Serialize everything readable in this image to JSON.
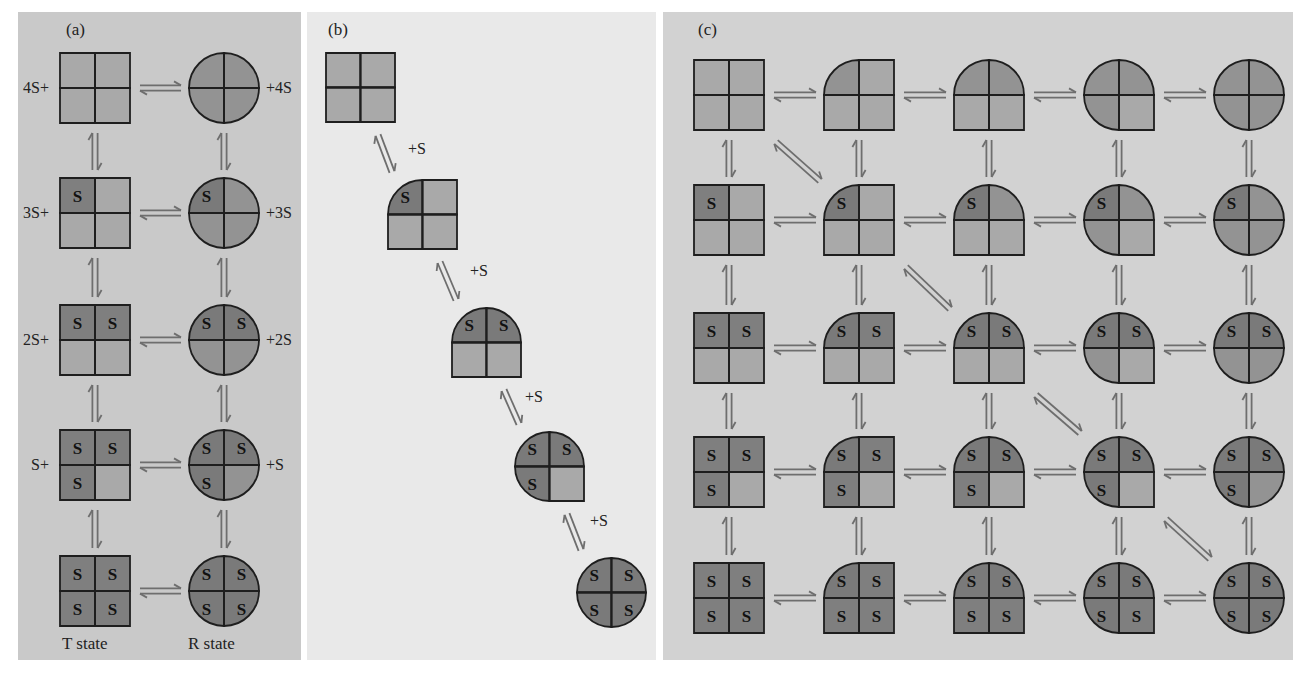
{
  "colors": {
    "panel_a_bg": "#c9c9c9",
    "panel_b_bg": "#e9e9e9",
    "panel_c_bg": "#d2d2d2",
    "t_subunit": "#a9a9a9",
    "r_subunit": "#939393",
    "bound_t_subunit": "#7f7f7f",
    "bound_r_subunit": "#7a7a7a",
    "outline": "#1e1e1e",
    "arrow": "#6e6e6e",
    "text": "#222222"
  },
  "panels": {
    "a": {
      "label": "(a)",
      "t_state_label": "T state",
      "r_state_label": "R state",
      "rows": [
        {
          "left_label": "4S+",
          "right_label": "+4S",
          "bound": 0
        },
        {
          "left_label": "3S+",
          "right_label": "+3S",
          "bound": 1
        },
        {
          "left_label": "2S+",
          "right_label": "+2S",
          "bound": 2
        },
        {
          "left_label": "S+",
          "right_label": "+S",
          "bound": 3
        },
        {
          "left_label": "",
          "right_label": "",
          "bound": 4
        }
      ]
    },
    "b": {
      "label": "(b)",
      "step_label": "+S",
      "states": [
        {
          "bound": 0,
          "r_subunits": 0
        },
        {
          "bound": 1,
          "r_subunits": 1
        },
        {
          "bound": 2,
          "r_subunits": 2
        },
        {
          "bound": 3,
          "r_subunits": 3
        },
        {
          "bound": 4,
          "r_subunits": 4
        }
      ]
    },
    "c": {
      "label": "(c)",
      "row_axis": "bound substrate count (0-4)",
      "col_axis": "R-state subunits (0-4)",
      "rows": 5,
      "cols": 5,
      "diagonals": [
        [
          0,
          0
        ],
        [
          1,
          1
        ],
        [
          2,
          2
        ],
        [
          3,
          3
        ]
      ]
    }
  },
  "glyphs": {
    "substrate": "S"
  }
}
